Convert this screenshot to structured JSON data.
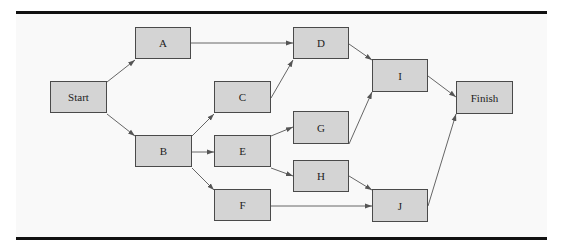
{
  "diagram": {
    "type": "activity-network",
    "colors": {
      "node_fill": "#d4d4d4",
      "node_border": "#4a4a4a",
      "edge": "#555555",
      "rule": "#111111"
    },
    "nodes": [
      {
        "id": "start",
        "label": "Start",
        "x": 50,
        "y": 81
      },
      {
        "id": "a",
        "label": "A",
        "x": 135,
        "y": 27
      },
      {
        "id": "b",
        "label": "B",
        "x": 135,
        "y": 135
      },
      {
        "id": "c",
        "label": "C",
        "x": 214,
        "y": 81
      },
      {
        "id": "d",
        "label": "D",
        "x": 293,
        "y": 27
      },
      {
        "id": "e",
        "label": "E",
        "x": 214,
        "y": 135
      },
      {
        "id": "f",
        "label": "F",
        "x": 214,
        "y": 189
      },
      {
        "id": "g",
        "label": "G",
        "x": 293,
        "y": 111
      },
      {
        "id": "h",
        "label": "H",
        "x": 293,
        "y": 160
      },
      {
        "id": "i",
        "label": "I",
        "x": 372,
        "y": 59
      },
      {
        "id": "j",
        "label": "J",
        "x": 372,
        "y": 189
      },
      {
        "id": "finish",
        "label": "Finish",
        "x": 456,
        "y": 81
      }
    ],
    "edges": [
      {
        "from": "Start",
        "to": "A"
      },
      {
        "from": "Start",
        "to": "B"
      },
      {
        "from": "A",
        "to": "D"
      },
      {
        "from": "B",
        "to": "C"
      },
      {
        "from": "B",
        "to": "E"
      },
      {
        "from": "B",
        "to": "F"
      },
      {
        "from": "C",
        "to": "D"
      },
      {
        "from": "E",
        "to": "G"
      },
      {
        "from": "E",
        "to": "H"
      },
      {
        "from": "D",
        "to": "I"
      },
      {
        "from": "G",
        "to": "I"
      },
      {
        "from": "H",
        "to": "J"
      },
      {
        "from": "F",
        "to": "J"
      },
      {
        "from": "I",
        "to": "Finish"
      },
      {
        "from": "J",
        "to": "Finish"
      }
    ]
  }
}
